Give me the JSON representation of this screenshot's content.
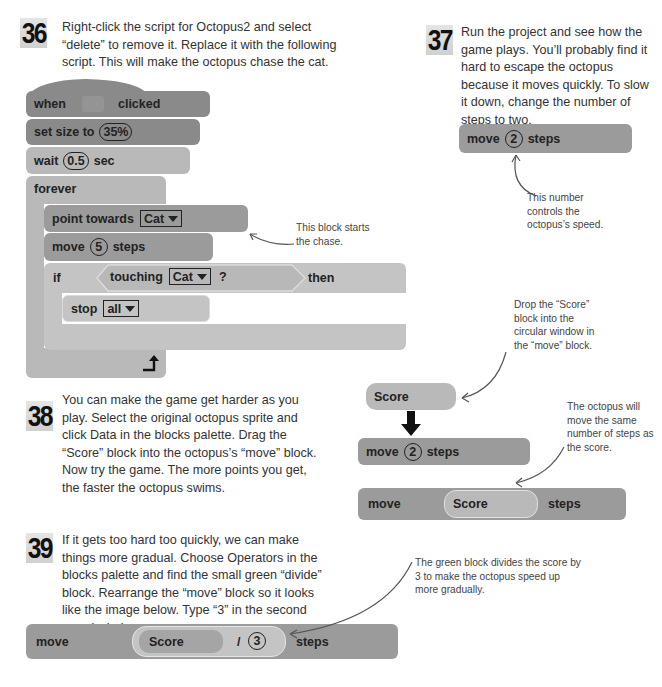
{
  "steps": [
    {
      "number": "36",
      "text": "Right-click the script for Octopus2 and select “delete” to remove it. Replace it with the following script. This will make the octopus chase the cat."
    },
    {
      "number": "37",
      "text": "Run the project and see how the game plays. You’ll probably find it hard to escape the octopus because it moves quickly. To slow it down, change the number of steps to two."
    },
    {
      "number": "38",
      "text": "You can make the game get harder as you play. Select the original octopus sprite and click Data in the blocks palette. Drag the “Score” block into the octopus’s “move” block. Now try the game. The more points you get, the faster the octopus swims."
    },
    {
      "number": "39",
      "text": "If it gets too hard too quickly, we can make things more gradual. Choose Operators in the blocks palette and find the small green “divide” block. Rearrange the “move” block so it looks like the image below. Type “3” in the second round window."
    }
  ],
  "script36": {
    "when": "when",
    "flag_icon": "green-flag-icon",
    "clicked": "clicked",
    "set_size": "set size to",
    "size_value": "35%",
    "wait": "wait",
    "wait_value": "0.5",
    "sec": "sec",
    "forever": "forever",
    "point_towards": "point towards",
    "point_target": "Cat",
    "move": "move",
    "move_value": "5",
    "steps": "steps",
    "if": "if",
    "touching": "touching",
    "touching_target": "Cat",
    "question": "?",
    "then": "then",
    "stop": "stop",
    "stop_value": "all",
    "loop_icon": "loop-arrow-icon"
  },
  "block37": {
    "move": "move",
    "value": "2",
    "steps": "steps"
  },
  "block38": {
    "score": "Score",
    "move_before": {
      "move": "move",
      "value": "2",
      "steps": "steps"
    },
    "move_after": {
      "move": "move",
      "score": "Score",
      "steps": "steps"
    }
  },
  "block39": {
    "move": "move",
    "score": "Score",
    "divide": "/",
    "value": "3",
    "steps": "steps"
  },
  "notes": {
    "chase": "This block starts the chase.",
    "speed": "This number controls the octopus’s speed.",
    "drop": "Drop the “Score” block into the circular window in the “move” block.",
    "same": "The octopus will move the same number of steps as the score.",
    "divide": "The green block divides the score by 3 to make the octopus speed up more gradually."
  }
}
